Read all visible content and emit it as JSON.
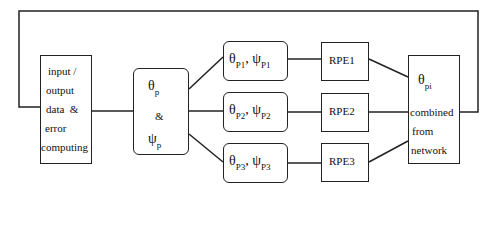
{
  "input_box": {
    "lines": [
      "input /",
      "output",
      "data  &",
      "error",
      "computing"
    ]
  },
  "param_box": {
    "theta": "θ",
    "theta_sub": "p",
    "amp": "&",
    "psi": "ψ",
    "psi_sub": "p"
  },
  "branches": [
    {
      "theta_sub": "P1",
      "psi_sub": "P1",
      "rpe": "RPE1"
    },
    {
      "theta_sub": "P2",
      "psi_sub": "P2",
      "rpe": "RPE2"
    },
    {
      "theta_sub": "P3",
      "psi_sub": "P3",
      "rpe": "RPE3"
    }
  ],
  "symbols": {
    "theta": "θ",
    "psi": "ψ",
    "comma": ","
  },
  "output_box": {
    "theta": "θ",
    "theta_sub": "pi",
    "lines": [
      "combined",
      "from",
      "network"
    ]
  }
}
